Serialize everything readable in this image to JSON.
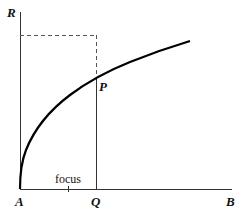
{
  "diagram": {
    "type": "parabola",
    "labels": {
      "vertical_axis": "R",
      "horizontal_axis": "B",
      "origin": "A",
      "point_on_axis": "Q",
      "point_on_curve": "P",
      "focus": "focus"
    }
  }
}
